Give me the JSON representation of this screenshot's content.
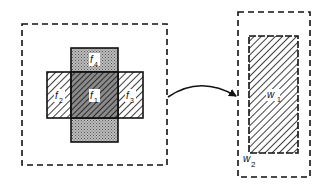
{
  "diagram": {
    "left_window": {
      "regions": [
        {
          "id": "f1",
          "label": "f",
          "subscript": "1",
          "fill": "dense-hatch-dark"
        },
        {
          "id": "f2",
          "label": "f",
          "subscript": "2",
          "fill": "hatch"
        },
        {
          "id": "f3",
          "label": "f",
          "subscript": "3",
          "fill": "hatch"
        },
        {
          "id": "f4",
          "label": "f",
          "subscript": "4",
          "fill": "stipple"
        },
        {
          "id": "f5",
          "label": "",
          "subscript": "",
          "fill": "stipple"
        }
      ]
    },
    "arrow": {
      "direction": "left-to-right",
      "style": "curved"
    },
    "right_window": {
      "inner": {
        "label": "w",
        "subscript": "1",
        "fill": "hatch"
      },
      "outer": {
        "label": "w",
        "subscript": "2",
        "border": "dashed"
      }
    },
    "colors": {
      "stroke": "#111111",
      "stipple": "#9a9a9a",
      "background": "#ffffff"
    }
  }
}
